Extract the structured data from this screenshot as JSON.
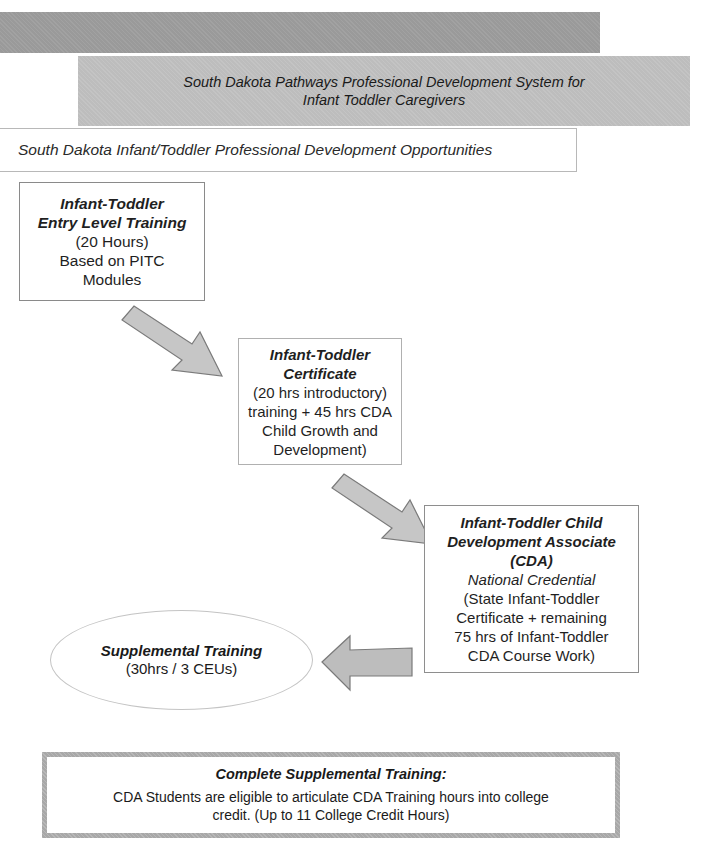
{
  "header": {
    "title_line1": "South Dakota Pathways Professional Development System for",
    "title_line2": "Infant Toddler Caregivers"
  },
  "subtitle": "South Dakota Infant/Toddler Professional Development Opportunities",
  "steps": [
    {
      "title_lines": [
        "Infant-Toddler",
        "Entry Level Training"
      ],
      "body_lines": [
        "(20 Hours)",
        "Based on PITC",
        "Modules"
      ]
    },
    {
      "title_lines": [
        "Infant-Toddler",
        "Certificate"
      ],
      "body_lines": [
        "(20 hrs introductory)",
        "training + 45 hrs CDA",
        "Child Growth and",
        "Development)"
      ]
    },
    {
      "title_lines": [
        "Infant-Toddler Child",
        "Development Associate",
        "(CDA)"
      ],
      "italic_line": "National Credential",
      "body_lines": [
        "(State Infant-Toddler",
        "Certificate + remaining",
        "75 hrs of Infant-Toddler",
        "CDA Course Work)"
      ]
    }
  ],
  "supplemental": {
    "title": "Supplemental Training",
    "detail": "(30hrs / 3 CEUs)"
  },
  "completion": {
    "heading": "Complete Supplemental Training:",
    "body": "CDA Students are eligible to articulate CDA Training hours into college credit. (Up to 11 College Credit Hours)"
  },
  "icons": {
    "arrow1": "arrow-down-right-icon",
    "arrow2": "arrow-down-right-icon",
    "arrow3": "arrow-left-icon"
  },
  "colors": {
    "band_dark": "#9a9a9a",
    "band_light": "#bdbdbd",
    "arrow_fill": "#c6c6c6",
    "arrow_stroke": "#7a7a7a"
  }
}
